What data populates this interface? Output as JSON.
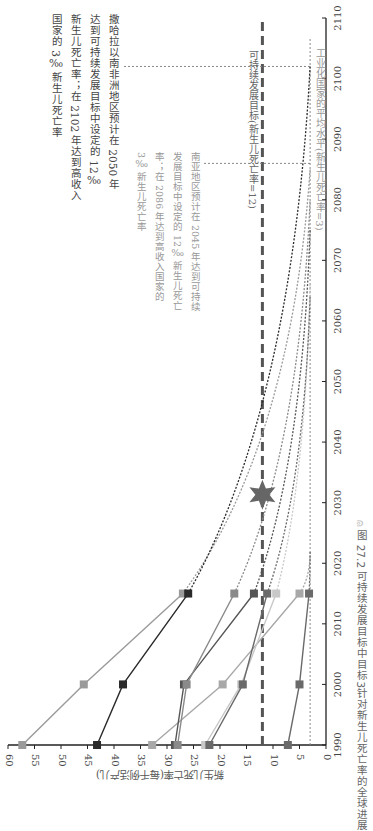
{
  "chart_data": {
    "type": "line",
    "orientation": "rotated-90-clockwise",
    "title": "图 27.2 可持续发展目标中目标3针对新生儿死亡率的全球进展",
    "xlabel": "",
    "ylabel": "新生儿死亡率(每千例活产儿)",
    "x_ticks": [
      1990,
      2000,
      2010,
      2020,
      2030,
      2040,
      2050,
      2060,
      2070,
      2080,
      2090,
      2100,
      2110
    ],
    "y_ticks": [
      0,
      5,
      10,
      15,
      20,
      25,
      30,
      35,
      40,
      45,
      50,
      55,
      60
    ],
    "xlim": [
      1990,
      2110
    ],
    "ylim": [
      0,
      60
    ],
    "observed_years": [
      1990,
      2000,
      2015
    ],
    "series": [
      {
        "name": "region-1",
        "color": "#9a9a9a",
        "values": [
          57.3,
          45.7,
          27.0
        ],
        "projection_end": [
          2085,
          3
        ]
      },
      {
        "name": "region-2",
        "color": "#2a2a2a",
        "values": [
          43.2,
          38.3,
          26.0
        ],
        "projection_end": [
          2102,
          3
        ]
      },
      {
        "name": "region-3",
        "color": "#a8a8a8",
        "values": [
          32.8,
          19.5,
          5.0
        ],
        "projection_end": [
          2021,
          3
        ]
      },
      {
        "name": "region-4",
        "color": "#555555",
        "values": [
          28.5,
          26.8,
          13.6
        ],
        "projection_end": [
          2075,
          3
        ]
      },
      {
        "name": "region-5",
        "color": "#8a8a8a",
        "values": [
          28.0,
          26.3,
          17.3
        ],
        "projection_end": [
          2080,
          3
        ]
      },
      {
        "name": "region-6",
        "color": "#c8c8c8",
        "values": [
          22.8,
          16.0,
          9.4
        ],
        "projection_end": [
          2066,
          3
        ]
      },
      {
        "name": "region-7",
        "color": "#6a6a6a",
        "values": [
          22.0,
          15.7,
          11.1
        ],
        "projection_end": [
          2064,
          3
        ]
      },
      {
        "name": "region-8",
        "color": "#6a6a6a",
        "values": [
          7.2,
          5.0,
          3.2
        ],
        "projection_end": [
          2022,
          3
        ]
      }
    ],
    "reference_lines": [
      {
        "name": "sdg-target",
        "value": 12,
        "style": "dashed-thick",
        "color": "#555555",
        "label": "可持续发展目标(新生儿死亡率=12)"
      },
      {
        "name": "industrialized-average",
        "value": 3,
        "style": "dotted",
        "color": "#888888",
        "label": "工业化国家的平均水平(新生儿死亡率=3)"
      }
    ],
    "marker": {
      "name": "sdg-2030-star",
      "year": 2030,
      "value": 12,
      "color": "#666666"
    },
    "annotations": [
      {
        "name": "sub-saharan-africa-note",
        "text": "撒哈拉以南非洲地区预计在2050年达到可持续发展目标中设定的12‰新生儿死亡率；在2102年达到高收入国家的3‰新生儿死亡率",
        "lines": [
          "撒哈拉以南非洲地区预计在 2050 年",
          "达到可持续发展目标中设定的 12‰",
          "新生儿死亡率；在 2102 年达到高收入",
          "国家的 3‰ 新生儿死亡率"
        ],
        "leader_year": 2102
      },
      {
        "name": "south-asia-note",
        "text": "南亚地区预计在2045年达到可持续发展目标中设定的12‰新生儿死亡率；在2086年达到高收入国家的3‰新生儿死亡率",
        "lines": [
          "南亚地区预计在 2045 年达到可持续",
          "发展目标中设定的 12‰ 新生儿死亡",
          "率；在 2086 年达到高收入国家的",
          "3‰ 新生儿死亡率"
        ],
        "leader_year": 2086
      }
    ]
  },
  "caption": {
    "figure_number": "图 27.2",
    "text": "可持续发展目标中目标3针对新生儿死亡率的全球进展"
  },
  "axis": {
    "ylabel": "新生儿死亡率(每千例活产儿)"
  }
}
